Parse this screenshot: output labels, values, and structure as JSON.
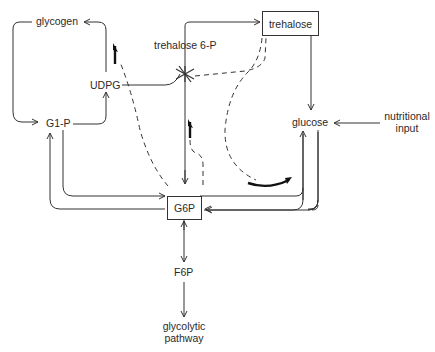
{
  "diagram": {
    "nodes": {
      "glycogen": "glycogen",
      "trehalose": "trehalose",
      "trehalose_6p": "trehalose 6-P",
      "udpg": "UDPG",
      "g1p": "G1-P",
      "glucose": "glucose",
      "nutritional_input_line1": "nutritional",
      "nutritional_input_line2": "input",
      "g6p": "G6P",
      "f6p": "F6P",
      "glycolytic_line1": "glycolytic",
      "glycolytic_line2": "pathway"
    },
    "edges": [
      {
        "from": "G1-P",
        "to": "glycogen",
        "style": "solid"
      },
      {
        "from": "glycogen",
        "to": "G1-P",
        "style": "solid"
      },
      {
        "from": "G1-P",
        "to": "UDPG",
        "style": "solid"
      },
      {
        "from": "UDPG",
        "to": "glycogen",
        "style": "solid"
      },
      {
        "from": "UDPG",
        "to": "trehalose 6-P",
        "style": "solid"
      },
      {
        "from": "trehalose 6-P",
        "to": "trehalose",
        "style": "solid"
      },
      {
        "from": "trehalose",
        "to": "glucose",
        "style": "solid"
      },
      {
        "from": "nutritional input",
        "to": "glucose",
        "style": "solid"
      },
      {
        "from": "glucose",
        "to": "G6P",
        "style": "solid"
      },
      {
        "from": "G6P",
        "to": "glucose",
        "style": "solid"
      },
      {
        "from": "G1-P",
        "to": "G6P",
        "style": "solid"
      },
      {
        "from": "G6P",
        "to": "G1-P",
        "style": "solid"
      },
      {
        "from": "G6P",
        "to": "trehalose 6-P",
        "style": "solid"
      },
      {
        "from": "G6P",
        "to": "F6P",
        "style": "solid"
      },
      {
        "from": "F6P",
        "to": "glycolytic pathway",
        "style": "solid"
      },
      {
        "from": "trehalose 6-P",
        "to": "trehalose",
        "style": "dashed-regulation"
      },
      {
        "from": "trehalose",
        "to": "glucose-G6P",
        "style": "dashed-regulation"
      },
      {
        "from": "G6P",
        "to": "UDPG-glycogen",
        "style": "dashed-regulation"
      },
      {
        "from": "G6P",
        "to": "trehalose 6-P",
        "style": "dashed-regulation"
      }
    ],
    "colors": {
      "line": "#333333",
      "text": "#2a2a2a",
      "background": "#ffffff"
    }
  }
}
